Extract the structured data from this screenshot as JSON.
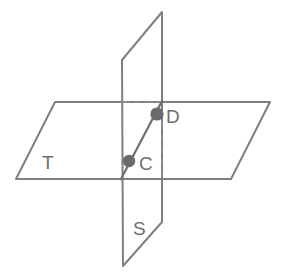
{
  "diagram": {
    "type": "geometry-figure",
    "canvas": {
      "width": 291,
      "height": 276,
      "background": "#ffffff"
    },
    "colors": {
      "solid_edge": "#7f7f7f",
      "hidden_edge": "#8a8a8a",
      "intersection_line": "#6f6f6f",
      "point_fill": "#6b6b6b",
      "label_text": "#6e6e6e"
    },
    "planes": [
      {
        "id": "plane-t",
        "label": "T",
        "orientation": "horizontal",
        "label_position": {
          "x": 42,
          "y": 164
        },
        "outline_points": "55,102 270,102 231,179 16,179"
      },
      {
        "id": "plane-s",
        "label": "S",
        "orientation": "vertical",
        "label_position": {
          "x": 133,
          "y": 230
        },
        "outline_points": "122,60 162,12 162,222 123,266"
      }
    ],
    "hidden_edges": [
      {
        "id": "hidden-top-horizontal",
        "from": {
          "x": 122,
          "y": 102
        },
        "to": {
          "x": 161,
          "y": 102
        }
      },
      {
        "id": "hidden-right-vertical",
        "from": {
          "x": 162,
          "y": 110
        },
        "to": {
          "x": 162,
          "y": 179
        }
      }
    ],
    "intersection_line": {
      "id": "line-cd",
      "from": {
        "x": 121,
        "y": 179
      },
      "to": {
        "x": 162,
        "y": 101
      }
    },
    "points": [
      {
        "id": "point-c",
        "label": "C",
        "cx": 129,
        "cy": 161,
        "r": 6.2,
        "label_position": {
          "x": 139,
          "y": 165
        }
      },
      {
        "id": "point-d",
        "label": "D",
        "cx": 157,
        "cy": 114,
        "r": 6.6,
        "label_position": {
          "x": 166,
          "y": 118
        }
      }
    ]
  },
  "chart_data": {
    "type": "diagram",
    "labels": [
      "T",
      "S",
      "C",
      "D"
    ],
    "annotations": [
      "Plane T is drawn as a horizontal parallelogram.",
      "Plane S is drawn as a vertical quadrilateral passing through plane T.",
      "Points C and D lie on the line where the two planes intersect."
    ]
  }
}
